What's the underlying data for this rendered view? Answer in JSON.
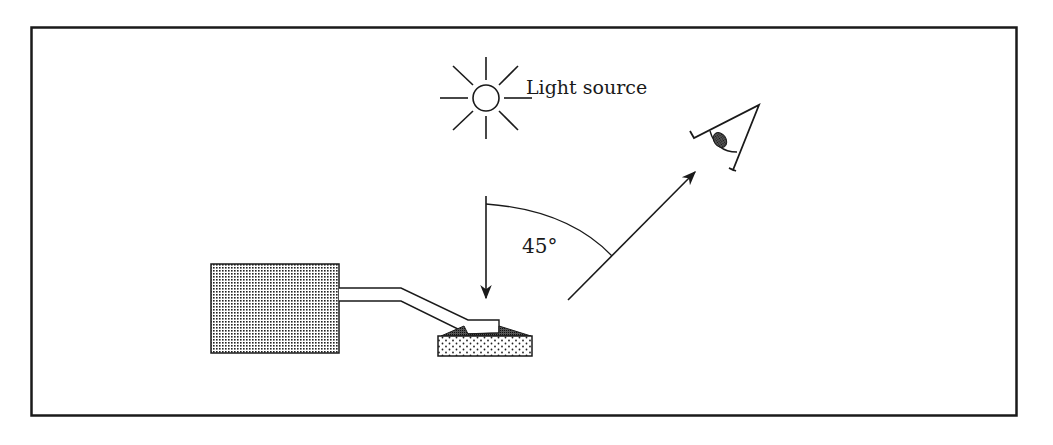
{
  "diagram": {
    "type": "optical-measurement-geometry",
    "labels": {
      "light_source": "Light source",
      "angle": "45°"
    },
    "elements": [
      {
        "name": "light-source",
        "description": "sun symbol with 8 rays"
      },
      {
        "name": "incident-arrow",
        "description": "vertical downward arrow onto sample"
      },
      {
        "name": "reflected-arrow",
        "description": "arrow from sample towards observer at 45 degrees"
      },
      {
        "name": "angle-arc",
        "description": "arc between incident and viewing direction",
        "value": "45°"
      },
      {
        "name": "observer-eye",
        "description": "eye symbol viewing the sample"
      },
      {
        "name": "instrument-box",
        "description": "dotted instrument housing"
      },
      {
        "name": "probe-arm",
        "description": "bent probe arm connecting instrument to sample"
      },
      {
        "name": "sample",
        "description": "dotted sample block"
      }
    ],
    "colors": {
      "stroke": "#1a1a1a",
      "background": "#ffffff"
    }
  }
}
